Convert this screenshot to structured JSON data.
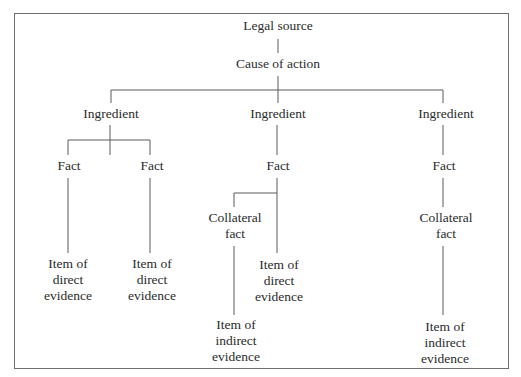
{
  "diagram": {
    "type": "tree",
    "nodes": {
      "legal_source": {
        "lines": [
          "Legal source"
        ]
      },
      "cause_of_action": {
        "lines": [
          "Cause of action"
        ]
      },
      "ingredient_left": {
        "lines": [
          "Ingredient"
        ]
      },
      "ingredient_middle": {
        "lines": [
          "Ingredient"
        ]
      },
      "ingredient_right": {
        "lines": [
          "Ingredient"
        ]
      },
      "fact_left_1": {
        "lines": [
          "Fact"
        ]
      },
      "fact_left_2": {
        "lines": [
          "Fact"
        ]
      },
      "fact_middle": {
        "lines": [
          "Fact"
        ]
      },
      "fact_right": {
        "lines": [
          "Fact"
        ]
      },
      "collateral_fact_middle": {
        "lines": [
          "Collateral",
          "fact"
        ]
      },
      "collateral_fact_right": {
        "lines": [
          "Collateral",
          "fact"
        ]
      },
      "item_direct_left_1": {
        "lines": [
          "Item of",
          "direct",
          "evidence"
        ]
      },
      "item_direct_left_2": {
        "lines": [
          "Item of",
          "direct",
          "evidence"
        ]
      },
      "item_direct_middle": {
        "lines": [
          "Item of",
          "direct",
          "evidence"
        ]
      },
      "item_indirect_middle": {
        "lines": [
          "Item of",
          "indirect",
          "evidence"
        ]
      },
      "item_indirect_right": {
        "lines": [
          "Item of",
          "indirect",
          "evidence"
        ]
      }
    },
    "edges": [
      [
        "legal_source",
        "cause_of_action"
      ],
      [
        "cause_of_action",
        "ingredient_left"
      ],
      [
        "cause_of_action",
        "ingredient_middle"
      ],
      [
        "cause_of_action",
        "ingredient_right"
      ],
      [
        "ingredient_left",
        "fact_left_1"
      ],
      [
        "ingredient_left",
        "fact_left_2"
      ],
      [
        "fact_left_1",
        "item_direct_left_1"
      ],
      [
        "fact_left_2",
        "item_direct_left_2"
      ],
      [
        "ingredient_middle",
        "fact_middle"
      ],
      [
        "fact_middle",
        "collateral_fact_middle"
      ],
      [
        "fact_middle",
        "item_direct_middle"
      ],
      [
        "collateral_fact_middle",
        "item_indirect_middle"
      ],
      [
        "ingredient_right",
        "fact_right"
      ],
      [
        "fact_right",
        "collateral_fact_right"
      ],
      [
        "collateral_fact_right",
        "item_indirect_right"
      ]
    ]
  }
}
